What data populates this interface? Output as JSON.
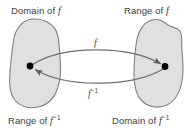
{
  "figure": {
    "background_color": "#ffffff",
    "blob_fill_color": "#e0e0e0",
    "blob_stroke_color": "#808080",
    "curve_color": "#6e6e6e",
    "point_color": "#000000",
    "text_color": "#404040"
  },
  "labels": {
    "domain_f": "Domain of ",
    "range_f": "Range of ",
    "range_f_inverse": "Range of ",
    "domain_f_inverse": "Domain of ",
    "function_symbol": "f",
    "inverse_exponent": "−1"
  },
  "arrows": {
    "forward_label": "f",
    "inverse_label": "f",
    "inverse_exponent": "−1",
    "forward_direction": "left-to-right",
    "inverse_direction": "right-to-left"
  },
  "points": {
    "left_point_label": "",
    "right_point_label": ""
  }
}
